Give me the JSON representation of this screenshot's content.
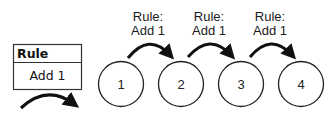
{
  "rule_box": {
    "header": "Rule",
    "body": "Add 1"
  },
  "sequence": [
    {
      "value": "1"
    },
    {
      "value": "2"
    },
    {
      "value": "3"
    },
    {
      "value": "4"
    }
  ],
  "transitions": [
    {
      "line1": "Rule:",
      "line2": "Add 1"
    },
    {
      "line1": "Rule:",
      "line2": "Add 1"
    },
    {
      "line1": "Rule:",
      "line2": "Add 1"
    }
  ],
  "colors": {
    "stroke": "#111111",
    "background": "#ffffff"
  }
}
